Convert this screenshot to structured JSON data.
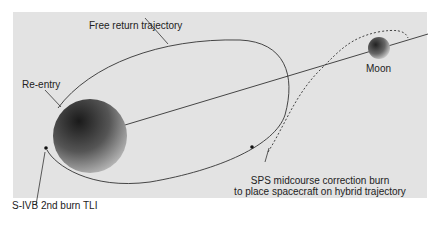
{
  "diagram": {
    "labels": {
      "free_return": "Free return trajectory",
      "reentry": "Re-entry",
      "moon": "Moon",
      "sps_line1": "SPS midcourse correction burn",
      "sps_line2": "to place spacecraft on hybrid trajectory",
      "tli": "S-IVB 2nd burn TLI"
    },
    "colors": {
      "background_panel": "#e3e3e3",
      "page": "#ffffff",
      "line": "#333333"
    }
  }
}
